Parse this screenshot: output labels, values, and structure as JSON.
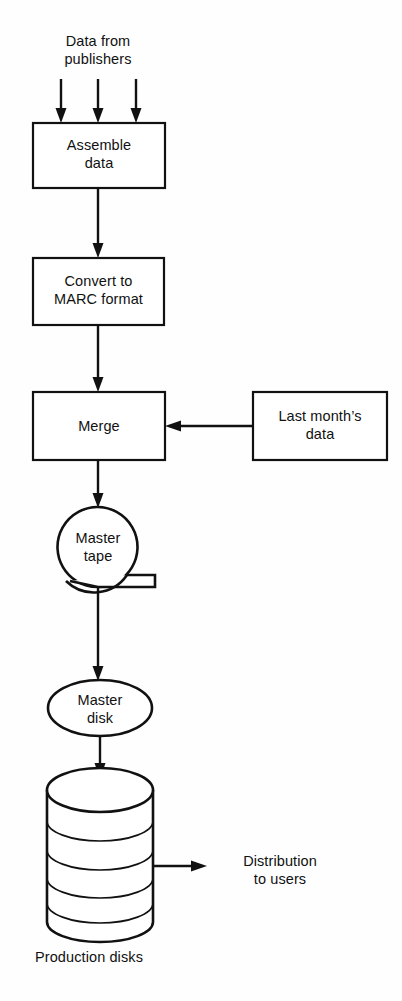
{
  "diagram": {
    "type": "flowchart",
    "background_color": "#fefefe",
    "line_color": "#111111",
    "fill_color": "#ffffff",
    "input_label": {
      "line1": "Data from",
      "line2": "publishers"
    },
    "nodes": [
      {
        "id": "assemble-data",
        "shape": "rectangle",
        "line1": "Assemble",
        "line2": "data"
      },
      {
        "id": "convert-marc",
        "shape": "rectangle",
        "line1": "Convert to",
        "line2": "MARC format"
      },
      {
        "id": "merge",
        "shape": "rectangle",
        "line1": "Merge",
        "line2": ""
      },
      {
        "id": "last-months-data",
        "shape": "rectangle",
        "line1": "Last month’s",
        "line2": "data"
      },
      {
        "id": "master-tape",
        "shape": "magnetic-tape",
        "line1": "Master",
        "line2": "tape"
      },
      {
        "id": "master-disk",
        "shape": "ellipse",
        "line1": "Master",
        "line2": "disk"
      },
      {
        "id": "production-disks",
        "shape": "disk-stack-cylinder",
        "line1": "Production disks",
        "line2": ""
      }
    ],
    "output_label": {
      "line1": "Distribution",
      "line2": "to users"
    },
    "input_arrow_count": 3,
    "platter_arc_count": 4
  }
}
